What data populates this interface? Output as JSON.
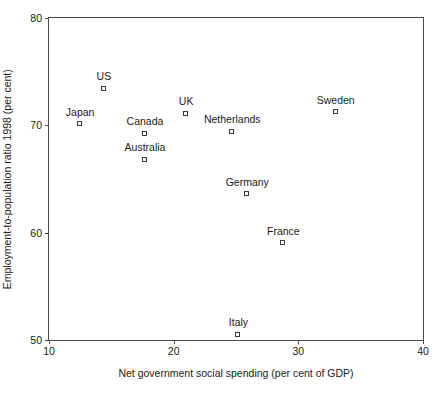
{
  "chart_data": {
    "type": "scatter",
    "title": "",
    "xlabel": "Net government social spending (per cent of GDP)",
    "ylabel": "Employment-to-population ratio 1998 (per cent)",
    "xlim": [
      10,
      40
    ],
    "ylim": [
      50,
      80
    ],
    "xticks": [
      10,
      20,
      30,
      40
    ],
    "yticks": [
      50,
      60,
      70,
      80
    ],
    "xtick_labels": [
      "10",
      "20",
      "30",
      "40"
    ],
    "ytick_labels": [
      "50",
      "60",
      "70",
      "80"
    ],
    "grid": false,
    "legend": false,
    "marker": "open-square",
    "marker_color": "#3a3a3a",
    "points": [
      {
        "label": "Japan",
        "x": 12.5,
        "y": 70.1
      },
      {
        "label": "US",
        "x": 14.4,
        "y": 73.4
      },
      {
        "label": "Canada",
        "x": 17.7,
        "y": 69.2
      },
      {
        "label": "Australia",
        "x": 17.7,
        "y": 66.8
      },
      {
        "label": "UK",
        "x": 21.0,
        "y": 71.1
      },
      {
        "label": "Netherlands",
        "x": 24.7,
        "y": 69.4
      },
      {
        "label": "Italy",
        "x": 25.2,
        "y": 50.5
      },
      {
        "label": "Germany",
        "x": 25.9,
        "y": 63.6
      },
      {
        "label": "France",
        "x": 28.8,
        "y": 59.0
      },
      {
        "label": "Sweden",
        "x": 33.0,
        "y": 71.2
      }
    ]
  }
}
